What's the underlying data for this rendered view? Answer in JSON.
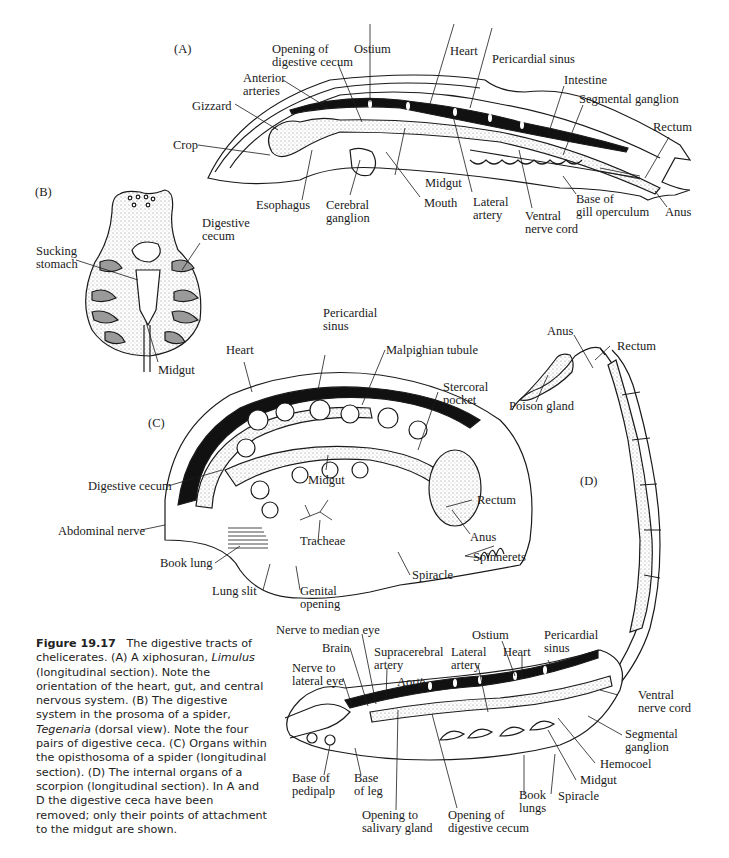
{
  "figure": {
    "number": "Figure 19.17",
    "caption_parts": {
      "p1": "The digestive tracts of chelicerates. (A) A xiphosuran, ",
      "genus1": "Limulus",
      "p2": " (longitudinal section). Note the orientation of the heart, gut, and central nervous system. (B) The digestive system in the prosoma of a spider, ",
      "genus2": "Tegenaria",
      "p3": " (dorsal view). Note the four pairs of digestive ceca. (C) Organs within the opisthosoma of a spider (longitudinal section). (D) The internal organs of a scorpion (longitudinal section). In A and D the digestive ceca have been removed; only their points of attachment to the midgut are shown."
    }
  },
  "panels": {
    "A": {
      "tag": "(A)",
      "labels": {
        "opening_cecum_1": "Opening of",
        "opening_cecum_2": "digestive cecum",
        "ostium": "Ostium",
        "heart": "Heart",
        "pericardial_sinus": "Pericardial sinus",
        "anterior_arteries_1": "Anterior",
        "anterior_arteries_2": "arteries",
        "intestine": "Intestine",
        "segmental_ganglion": "Segmental ganglion",
        "gizzard": "Gizzard",
        "rectum": "Rectum",
        "crop": "Crop",
        "midgut": "Midgut",
        "esophagus": "Esophagus",
        "cerebral_ganglion_1": "Cerebral",
        "cerebral_ganglion_2": "ganglion",
        "mouth": "Mouth",
        "lateral_artery_1": "Lateral",
        "lateral_artery_2": "artery",
        "ventral_nerve_cord_1": "Ventral",
        "ventral_nerve_cord_2": "nerve cord",
        "gill_operculum_1": "Base of",
        "gill_operculum_2": "gill operculum",
        "anus": "Anus"
      }
    },
    "B": {
      "tag": "(B)",
      "labels": {
        "digestive_cecum_1": "Digestive",
        "digestive_cecum_2": "cecum",
        "sucking_stomach_1": "Sucking",
        "sucking_stomach_2": "stomach",
        "midgut": "Midgut"
      }
    },
    "C": {
      "tag": "(C)",
      "labels": {
        "pericardial_sinus_1": "Pericardial",
        "pericardial_sinus_2": "sinus",
        "heart": "Heart",
        "malpighian_tubule": "Malpighian tubule",
        "stercoral_pocket_1": "Stercoral",
        "stercoral_pocket_2": "pocket",
        "digestive_cecum": "Digestive cecum",
        "midgut": "Midgut",
        "rectum": "Rectum",
        "abdominal_nerve": "Abdominal nerve",
        "anus": "Anus",
        "tracheae": "Tracheae",
        "spinnerets": "Spinnerets",
        "book_lung": "Book lung",
        "spiracle": "Spiracle",
        "lung_slit": "Lung slit",
        "genital_opening_1": "Genital",
        "genital_opening_2": "opening"
      }
    },
    "D": {
      "tag": "(D)",
      "labels": {
        "anus": "Anus",
        "rectum": "Rectum",
        "poison_gland": "Poison gland",
        "nerve_median_eye": "Nerve to median eye",
        "ostium": "Ostium",
        "pericardial_sinus_1": "Pericardial",
        "pericardial_sinus_2": "sinus",
        "brain": "Brain",
        "supracerebral_1": "Supracerebral",
        "supracerebral_2": "artery",
        "lateral_artery_1": "Lateral",
        "lateral_artery_2": "artery",
        "heart": "Heart",
        "nerve_lateral_eye_1": "Nerve to",
        "nerve_lateral_eye_2": "lateral eye",
        "aorta": "Aorta",
        "ventral_nerve_cord_1": "Ventral",
        "ventral_nerve_cord_2": "nerve cord",
        "segmental_ganglion_1": "Segmental",
        "segmental_ganglion_2": "ganglion",
        "hemocoel": "Hemocoel",
        "base_pedipalp_1": "Base of",
        "base_pedipalp_2": "pedipalp",
        "base_leg_1": "Base",
        "base_leg_2": "of leg",
        "midgut": "Midgut",
        "book_lungs_1": "Book",
        "book_lungs_2": "lungs",
        "spiracle": "Spiracle",
        "opening_salivary_1": "Opening to",
        "opening_salivary_2": "salivary gland",
        "opening_cecum_1": "Opening of",
        "opening_cecum_2": "digestive cecum"
      }
    }
  },
  "colors": {
    "ink": "#1a1a1a",
    "stipple": "#d9d9d9",
    "cecum_gray": "#9a9a9a",
    "paper": "#ffffff"
  }
}
